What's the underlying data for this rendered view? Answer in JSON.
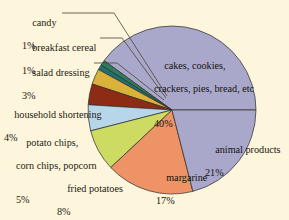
{
  "figure": {
    "background_color": "#fdf6dc",
    "text_color": "#1d1a14",
    "slice_outline_color": "#2b2b2b",
    "leader_line_color": "#4a4438"
  },
  "chart_data": {
    "type": "pie",
    "title": "",
    "subtitle": "",
    "xlabel": "",
    "ylabel": "",
    "legend_position": "none",
    "grid": false,
    "units": "percent",
    "total": 100,
    "start_angle_deg": 0,
    "direction": "counterclockwise",
    "categories": [
      "animal products",
      "cakes, cookies, crackers, pies, bread, etc",
      "candy",
      "breakfast cereal",
      "salad dressing",
      "household shortening",
      "potato chips, corn chips, popcorn",
      "fried potatoes",
      "margarine"
    ],
    "values": [
      21,
      40,
      1,
      1,
      3,
      4,
      5,
      8,
      17
    ],
    "colors": [
      "#a9a8cb",
      "#a9a8cb",
      "#2f7d5c",
      "#1f6f6f",
      "#d8b23a",
      "#8e2b15",
      "#b7d6ea",
      "#cddb62",
      "#ee9366"
    ],
    "slices": [
      {
        "label": "cakes, cookies, crackers, pies, bread, etc",
        "value": 40,
        "percent_text": "40%",
        "color": "#a9a8cb",
        "label_style": "inside",
        "label_lines": [
          "cakes, cookies,",
          "crackers, pies, bread, etc"
        ]
      },
      {
        "label": "candy",
        "value": 1,
        "percent_text": "1%",
        "color": "#2f7d5c",
        "label_style": "callout",
        "label_lines": [
          "candy"
        ]
      },
      {
        "label": "breakfast cereal",
        "value": 1,
        "percent_text": "1%",
        "color": "#1f6f6f",
        "label_style": "callout",
        "label_lines": [
          "breakfast cereal"
        ]
      },
      {
        "label": "salad dressing",
        "value": 3,
        "percent_text": "3%",
        "color": "#d8b23a",
        "label_style": "callout",
        "label_lines": [
          "salad dressing"
        ]
      },
      {
        "label": "household shortening",
        "value": 4,
        "percent_text": "4%",
        "color": "#8e2b15",
        "label_style": "callout",
        "label_lines": [
          "household shortening"
        ]
      },
      {
        "label": "potato chips, corn chips, popcorn",
        "value": 5,
        "percent_text": "5%",
        "color": "#b7d6ea",
        "label_style": "callout",
        "label_lines": [
          "potato chips,",
          "corn chips, popcorn"
        ]
      },
      {
        "label": "fried potatoes",
        "value": 8,
        "percent_text": "8%",
        "color": "#cddb62",
        "label_style": "callout",
        "label_lines": [
          "fried potatoes"
        ]
      },
      {
        "label": "margarine",
        "value": 17,
        "percent_text": "17%",
        "color": "#ee9366",
        "label_style": "inside",
        "label_lines": [
          "margarine"
        ]
      },
      {
        "label": "animal products",
        "value": 21,
        "percent_text": "21%",
        "color": "#a9a8cb",
        "label_style": "inside",
        "label_lines": [
          "animal products"
        ]
      }
    ]
  },
  "labels": {
    "candy": {
      "name": "candy",
      "pct": "1%"
    },
    "breakfast_cereal": {
      "name": "breakfast cereal",
      "pct": "1%"
    },
    "salad_dressing": {
      "name": "salad dressing",
      "pct": "3%"
    },
    "household_shortening": {
      "name": "household shortening",
      "pct": "4%"
    },
    "potato_chips_l1": {
      "name": "potato chips,",
      "l2": "corn chips, popcorn",
      "pct": "5%"
    },
    "fried_potatoes": {
      "name": "fried potatoes",
      "pct": "8%"
    },
    "margarine": {
      "name": "margarine",
      "pct": "17%"
    },
    "animal_products": {
      "name": "animal products",
      "pct": "21%"
    },
    "cakes_l1": {
      "name": "cakes, cookies,",
      "l2": "crackers, pies, bread, etc",
      "pct": "40%"
    }
  }
}
